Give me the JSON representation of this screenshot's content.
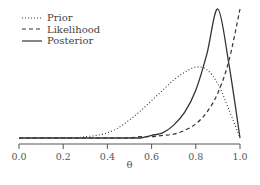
{
  "chart_data": {
    "type": "line",
    "title": "",
    "xlabel": "θ",
    "ylabel": "",
    "xlim": [
      0.0,
      1.0
    ],
    "x_ticks": [
      "0.0",
      "0.2",
      "0.4",
      "0.6",
      "0.8",
      "1.0"
    ],
    "grid": false,
    "y_axis_visible": false,
    "legend_position": "top-left",
    "x": [
      0.0,
      0.05,
      0.1,
      0.15,
      0.2,
      0.25,
      0.3,
      0.35,
      0.4,
      0.45,
      0.5,
      0.55,
      0.6,
      0.65,
      0.7,
      0.75,
      0.8,
      0.85,
      0.9,
      0.95,
      1.0
    ],
    "series": [
      {
        "name": "Prior",
        "style": "dotted",
        "description": "Beta-shaped density, mode near 0.8",
        "values": [
          0.0,
          0.0,
          0.0,
          0.0,
          0.0,
          0.0,
          0.01,
          0.02,
          0.04,
          0.08,
          0.14,
          0.21,
          0.29,
          0.37,
          0.45,
          0.51,
          0.55,
          0.53,
          0.42,
          0.22,
          0.0
        ]
      },
      {
        "name": "Likelihood",
        "style": "dashed",
        "description": "Increasing curve proportional to θ^10",
        "values": [
          0.0,
          0.0,
          0.0,
          0.0,
          0.0,
          0.0,
          0.0,
          0.0,
          0.0,
          0.0,
          0.0,
          0.01,
          0.01,
          0.02,
          0.03,
          0.06,
          0.11,
          0.2,
          0.35,
          0.6,
          1.0
        ]
      },
      {
        "name": "Posterior",
        "style": "solid",
        "description": "Beta-shaped density, mode near 0.9",
        "values": [
          0.0,
          0.0,
          0.0,
          0.0,
          0.0,
          0.0,
          0.0,
          0.0,
          0.0,
          0.0,
          0.0,
          0.0,
          0.02,
          0.04,
          0.1,
          0.2,
          0.37,
          0.65,
          1.0,
          0.57,
          0.0
        ]
      }
    ],
    "y_scale_note": "values normalized; likelihood max = 1.0 at top of plot, posterior peak ~0.53 of plot height, prior peak ~0.29 of plot height"
  },
  "legend": {
    "items": [
      {
        "label": "Prior",
        "style": "dotted"
      },
      {
        "label": "Likelihood",
        "style": "dashed"
      },
      {
        "label": "Posterior",
        "style": "solid"
      }
    ]
  },
  "colors": {
    "line": "#333333",
    "axis": "#555555",
    "text": "#555555"
  }
}
